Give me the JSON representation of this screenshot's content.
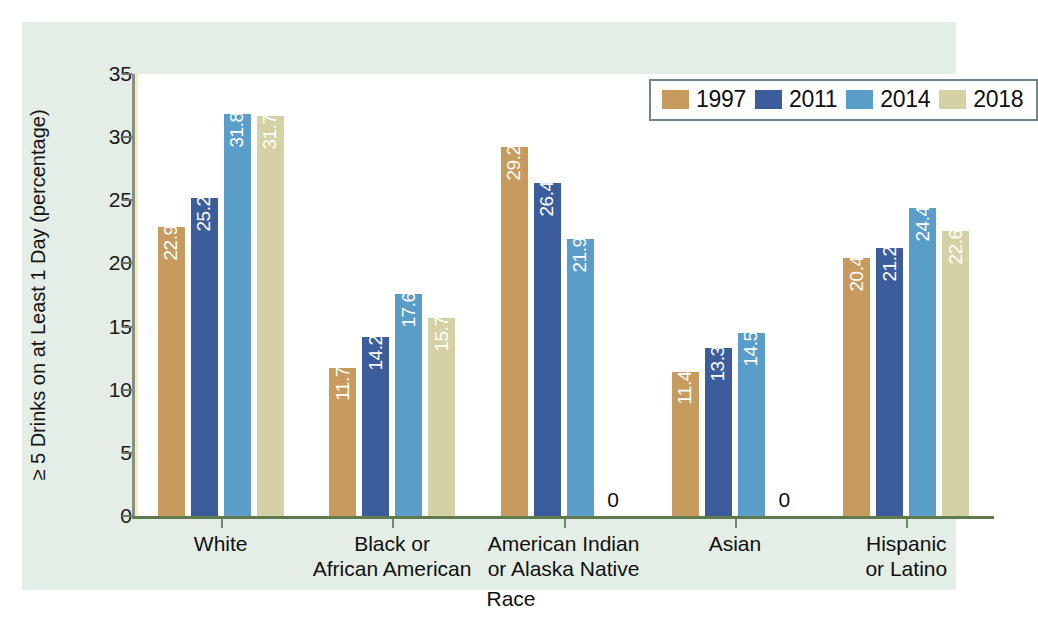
{
  "chart_data": {
    "type": "bar",
    "title": "",
    "xlabel": "Race",
    "ylabel": "≥ 5 Drinks on at Least 1 Day (percentage)",
    "ylim": [
      0,
      35
    ],
    "yticks": [
      0,
      5,
      10,
      15,
      20,
      25,
      30,
      35
    ],
    "grid": false,
    "legend_position": "top-right",
    "categories": [
      "White",
      "Black or African American",
      "American Indian or Alaska Native",
      "Asian",
      "Hispanic or Latino"
    ],
    "category_lines": [
      [
        "White"
      ],
      [
        "Black or",
        "African American"
      ],
      [
        "American Indian",
        "or Alaska Native"
      ],
      [
        "Asian"
      ],
      [
        "Hispanic",
        "or Latino"
      ]
    ],
    "series": [
      {
        "name": "1997",
        "color": "#c79a5e",
        "values": [
          22.9,
          11.7,
          29.2,
          11.4,
          20.4
        ],
        "labels": [
          "22.9",
          "11.7",
          "29.2",
          "11.4",
          "20.4"
        ]
      },
      {
        "name": "2011",
        "color": "#3c5d9b",
        "values": [
          25.2,
          14.2,
          26.4,
          13.3,
          21.2
        ],
        "labels": [
          "25.2",
          "14.2",
          "26.4",
          "13.3",
          "21.2"
        ]
      },
      {
        "name": "2014",
        "color": "#5b9dc9",
        "values": [
          31.8,
          17.6,
          21.9,
          14.5,
          24.4
        ],
        "labels": [
          "31.8",
          "17.6",
          "21.9",
          "14.5",
          "24.4"
        ]
      },
      {
        "name": "2018",
        "color": "#d4d2a4",
        "values": [
          31.7,
          15.7,
          0,
          0,
          22.6
        ],
        "labels": [
          "31.7",
          "15.7",
          "0",
          "0",
          "22.6"
        ]
      }
    ]
  },
  "legend": {
    "entries": [
      {
        "label": "1997",
        "color": "#c79a5e"
      },
      {
        "label": "2011",
        "color": "#3c5d9b"
      },
      {
        "label": "2014",
        "color": "#5b9dc9"
      },
      {
        "label": "2018",
        "color": "#d4d2a4"
      }
    ]
  },
  "axes": {
    "y_title": "≥ 5 Drinks on at Least 1 Day (percentage)",
    "x_title": "Race",
    "y_ticks": [
      "35",
      "30",
      "25",
      "20",
      "15",
      "10",
      "5",
      "0"
    ]
  },
  "colors": {
    "panel_background": "#e4eee6",
    "plot_background": "#ffffff",
    "baseline": "#5f7a4e",
    "axis": "#8a8f86",
    "legend_border": "#6f8a86",
    "text": "#101010",
    "value_label": "#ffffff"
  }
}
